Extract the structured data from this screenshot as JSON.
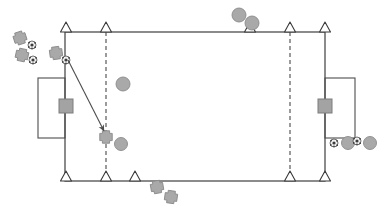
{
  "diagram": {
    "canvas": {
      "width": 391,
      "height": 213,
      "background": "#ffffff"
    },
    "colors": {
      "line": "#4d4d4d",
      "dashed_line": "#595959",
      "cone_fill": "#ffffff",
      "cone_stroke": "#3a3a3a",
      "marker_fill": "#a9a9a9",
      "marker_stroke": "#8a8a8a",
      "goal_fill": "#a3a3a3",
      "goal_stroke": "#7d7d7d",
      "ball_fill": "#f2f2f2",
      "ball_stroke": "#4d4d4d",
      "ball_patch": "#3d3d3d",
      "arrow": "#4d4d4d"
    },
    "field": {
      "label": "playing-area",
      "x": 65,
      "y": 32,
      "width": 260,
      "height": 149,
      "stroke_width": 1.3
    },
    "goal_boxes": [
      {
        "label": "left-goal-box",
        "x": 38,
        "y": 78,
        "width": 27,
        "height": 60
      },
      {
        "label": "right-goal-box",
        "x": 325,
        "y": 78,
        "width": 30,
        "height": 60
      }
    ],
    "goals": [
      {
        "label": "left-goal",
        "cx": 66,
        "cy": 106,
        "size": 14
      },
      {
        "label": "right-goal",
        "cx": 325,
        "cy": 106,
        "size": 14
      }
    ],
    "dashed_lines": [
      {
        "label": "left-dashed-line",
        "x": 106,
        "y1": 32,
        "y2": 181
      },
      {
        "label": "right-dashed-line",
        "x": 290,
        "y1": 32,
        "y2": 181
      }
    ],
    "cones": [
      {
        "label": "cone-top-1",
        "cx": 66,
        "cy": 32
      },
      {
        "label": "cone-top-2",
        "cx": 106,
        "cy": 32
      },
      {
        "label": "cone-top-3",
        "cx": 250,
        "cy": 32
      },
      {
        "label": "cone-top-4",
        "cx": 290,
        "cy": 32
      },
      {
        "label": "cone-top-5",
        "cx": 325,
        "cy": 32
      },
      {
        "label": "cone-bottom-1",
        "cx": 66,
        "cy": 181
      },
      {
        "label": "cone-bottom-2",
        "cx": 106,
        "cy": 181
      },
      {
        "label": "cone-bottom-3",
        "cx": 135,
        "cy": 181
      },
      {
        "label": "cone-bottom-4",
        "cx": 290,
        "cy": 181
      },
      {
        "label": "cone-bottom-5",
        "cx": 325,
        "cy": 181
      }
    ],
    "crosses": [
      {
        "label": "cross-left-1",
        "cx": 20,
        "cy": 38,
        "size": 12,
        "rotation": -18
      },
      {
        "label": "cross-left-2",
        "cx": 22,
        "cy": 55,
        "size": 12,
        "rotation": 12
      },
      {
        "label": "cross-left-3",
        "cx": 56,
        "cy": 53,
        "size": 12,
        "rotation": -8
      },
      {
        "label": "cross-center",
        "cx": 106,
        "cy": 137,
        "size": 12,
        "rotation": 0
      },
      {
        "label": "cross-bottom-1",
        "cx": 157,
        "cy": 187,
        "size": 12,
        "rotation": -10
      },
      {
        "label": "cross-bottom-2",
        "cx": 171,
        "cy": 197,
        "size": 12,
        "rotation": 8
      }
    ],
    "markers": [
      {
        "label": "marker-top-1",
        "cx": 239,
        "cy": 15,
        "r": 7
      },
      {
        "label": "marker-top-2",
        "cx": 252,
        "cy": 23,
        "r": 7
      },
      {
        "label": "marker-mid-field",
        "cx": 123,
        "cy": 84,
        "r": 7
      },
      {
        "label": "marker-center-cross",
        "cx": 121,
        "cy": 144,
        "r": 6.5
      },
      {
        "label": "marker-right-1",
        "cx": 348,
        "cy": 143,
        "r": 6.5
      },
      {
        "label": "marker-right-2",
        "cx": 370,
        "cy": 143,
        "r": 6.5
      }
    ],
    "balls": [
      {
        "label": "ball-left-1",
        "cx": 32,
        "cy": 45,
        "r": 4
      },
      {
        "label": "ball-left-2",
        "cx": 33,
        "cy": 60,
        "r": 4
      },
      {
        "label": "ball-left-3",
        "cx": 66,
        "cy": 60,
        "r": 4
      },
      {
        "label": "ball-right-1",
        "cx": 334,
        "cy": 143,
        "r": 4
      },
      {
        "label": "ball-right-2",
        "cx": 357,
        "cy": 141,
        "r": 4
      }
    ],
    "arrows": [
      {
        "label": "run-arrow",
        "x1": 68,
        "y1": 60,
        "x2": 104,
        "y2": 131
      }
    ]
  }
}
